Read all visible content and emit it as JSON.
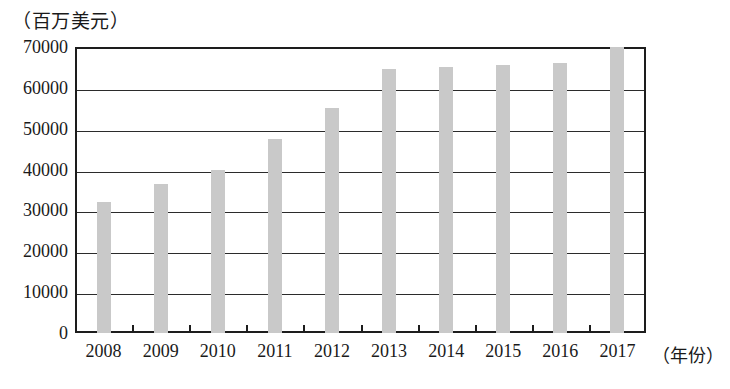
{
  "chart_data": {
    "type": "bar",
    "title": "",
    "unit_label": "（百万美元）",
    "xlabel": "（年份）",
    "ylabel": "",
    "categories": [
      "2008",
      "2009",
      "2010",
      "2011",
      "2012",
      "2013",
      "2014",
      "2015",
      "2016",
      "2017"
    ],
    "values": [
      32000,
      36500,
      40000,
      47500,
      55000,
      64500,
      65000,
      65500,
      66000,
      70000
    ],
    "ylim": [
      0,
      70000
    ],
    "ytick_labels": [
      "70000",
      "60000",
      "50000",
      "40000",
      "30000",
      "20000",
      "10000",
      "0"
    ],
    "ytick_values": [
      70000,
      60000,
      50000,
      40000,
      30000,
      20000,
      10000,
      0
    ],
    "grid": true,
    "legend": "none",
    "bar_color": "#c9c9c9",
    "axis_color": "#1d1d1d"
  }
}
